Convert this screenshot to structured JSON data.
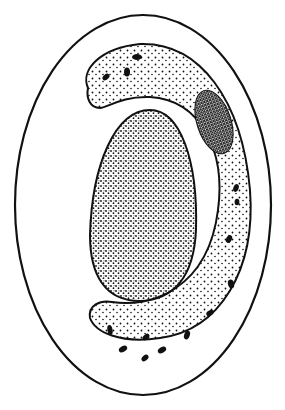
{
  "figure": {
    "colors": {
      "background": "#ffffff",
      "ink": "#111111"
    },
    "parts": [
      {
        "name": "outer-wall",
        "shape": "ellipse"
      },
      {
        "name": "curved-body",
        "shape": "C-shaped band",
        "texture": "sparse stipple with dark oval granules"
      },
      {
        "name": "nucleus",
        "shape": "egg-shaped oval",
        "texture": "dense stipple"
      },
      {
        "name": "dark-inclusion",
        "shape": "small elongated oval",
        "texture": "very dense stipple"
      }
    ]
  }
}
